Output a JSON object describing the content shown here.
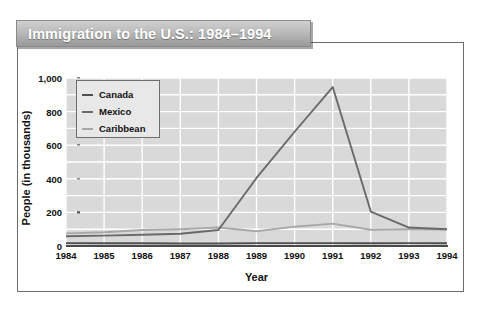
{
  "title": "Immigration to the U.S.: 1984–1994",
  "chart_data": {
    "type": "line",
    "title": "Immigration to the U.S.: 1984–1994",
    "xlabel": "Year",
    "ylabel": "People (in thousands)",
    "categories": [
      "1984",
      "1985",
      "1986",
      "1987",
      "1988",
      "1989",
      "1990",
      "1991",
      "1992",
      "1993",
      "1994"
    ],
    "xtick_labels": [
      "1984",
      "1985",
      "1986",
      "1987",
      "1988",
      "1989",
      "1990",
      "1991",
      "1992",
      "1993",
      "1994"
    ],
    "ytick_labels": [
      "0",
      "200",
      "400",
      "600",
      "800",
      "1,000"
    ],
    "ytick_values": [
      0,
      200,
      400,
      600,
      800,
      1000
    ],
    "ylim": [
      0,
      1000
    ],
    "grid": true,
    "legend_position": "upper-left-inside",
    "series": [
      {
        "name": "Canada",
        "color": "#4f4f4f",
        "values": [
          17,
          16,
          16,
          15,
          15,
          17,
          17,
          17,
          16,
          17,
          16
        ]
      },
      {
        "name": "Mexico",
        "color": "#6a6a6a",
        "values": [
          58,
          62,
          67,
          73,
          95,
          405,
          680,
          946,
          205,
          110,
          100
        ]
      },
      {
        "name": "Caribbean",
        "color": "#a8a8a8",
        "values": [
          75,
          82,
          95,
          100,
          110,
          88,
          115,
          133,
          97,
          100,
          98
        ]
      }
    ]
  },
  "legend": {
    "entries": [
      {
        "label": "Canada"
      },
      {
        "label": "Mexico"
      },
      {
        "label": "Caribbean"
      }
    ]
  },
  "colors": {
    "banner_text": "#ffffff",
    "plot_background": "#d9d9d9",
    "gridline": "#ffffff",
    "axis": "#4a4a4a",
    "frame": "#6c6c6c"
  }
}
